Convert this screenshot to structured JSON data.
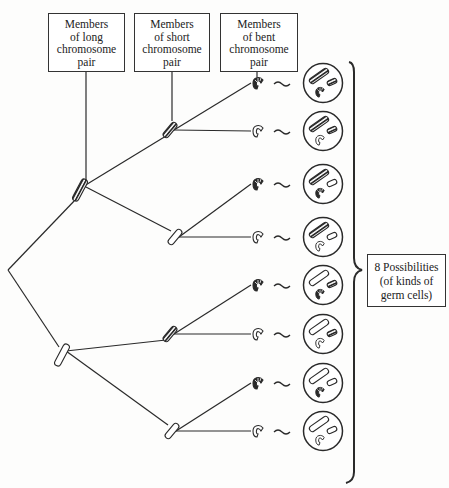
{
  "headers": [
    {
      "lines": [
        "Members",
        "of long",
        "chromosome",
        "pair"
      ]
    },
    {
      "lines": [
        "Members",
        "of short",
        "chromosome",
        "pair"
      ]
    },
    {
      "lines": [
        "Members",
        "of bent",
        "chromosome",
        "pair"
      ]
    }
  ],
  "result_label": {
    "lines": [
      "8 Possibilities",
      "(of kinds of",
      "germ cells)"
    ]
  },
  "tree": {
    "root": {
      "x": 8,
      "y": 270
    },
    "long": [
      {
        "type": "hatched",
        "x": 80,
        "y": 190
      },
      {
        "type": "plain",
        "x": 62,
        "y": 355
      }
    ],
    "short": [
      {
        "type": "hatched",
        "x": 170,
        "y": 130,
        "parent": 0
      },
      {
        "type": "plain",
        "x": 175,
        "y": 237,
        "parent": 0
      },
      {
        "type": "hatched",
        "x": 170,
        "y": 334,
        "parent": 1
      },
      {
        "type": "plain",
        "x": 172,
        "y": 431,
        "parent": 1
      }
    ],
    "bent": [
      {
        "type": "dark",
        "parent": 0
      },
      {
        "type": "light",
        "parent": 0
      },
      {
        "type": "dark",
        "parent": 1
      },
      {
        "type": "light",
        "parent": 1
      },
      {
        "type": "dark",
        "parent": 2
      },
      {
        "type": "light",
        "parent": 2
      },
      {
        "type": "dark",
        "parent": 3
      },
      {
        "type": "light",
        "parent": 3
      }
    ]
  },
  "germ_cells": [
    {
      "long": "hatched",
      "short": "hatched",
      "bent": "dark"
    },
    {
      "long": "hatched",
      "short": "hatched",
      "bent": "light"
    },
    {
      "long": "hatched",
      "short": "plain",
      "bent": "dark"
    },
    {
      "long": "hatched",
      "short": "plain",
      "bent": "light"
    },
    {
      "long": "plain",
      "short": "hatched",
      "bent": "dark"
    },
    {
      "long": "plain",
      "short": "hatched",
      "bent": "light"
    },
    {
      "long": "plain",
      "short": "plain",
      "bent": "dark"
    },
    {
      "long": "plain",
      "short": "plain",
      "bent": "light"
    }
  ],
  "colors": {
    "line": "#2a2a2a",
    "fill_dark": "#333333",
    "fill_light": "#ffffff"
  }
}
